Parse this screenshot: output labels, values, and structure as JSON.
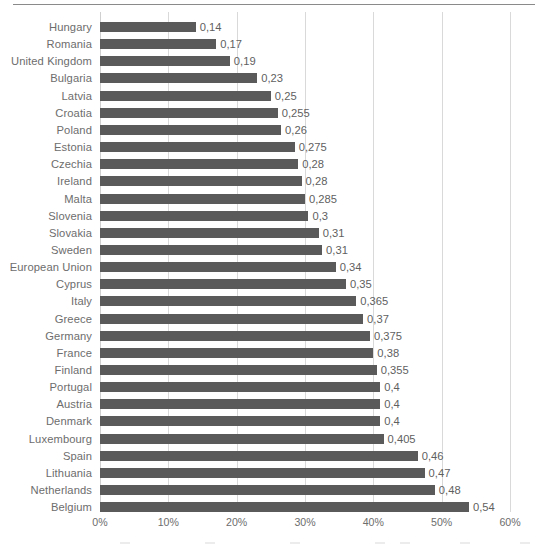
{
  "chart_data": {
    "type": "bar",
    "orientation": "horizontal",
    "title": "",
    "subtitle": "",
    "xlabel": "",
    "ylabel": "",
    "xlim": [
      0,
      0.6
    ],
    "xtick_labels": [
      "0%",
      "10%",
      "20%",
      "30%",
      "40%",
      "50%",
      "60%"
    ],
    "xtick_values": [
      0,
      0.1,
      0.2,
      0.3,
      0.4,
      0.5,
      0.6
    ],
    "grid": "vertical",
    "legend": "none",
    "bar_color": "#5a5a5a",
    "gridline_color": "#d9d9d9",
    "label_color": "#6d6d6d",
    "decimal_separator": ",",
    "categories": [
      "Hungary",
      "Romania",
      "United Kingdom",
      "Bulgaria",
      "Latvia",
      "Croatia",
      "Poland",
      "Estonia",
      "Czechia",
      "Ireland",
      "Malta",
      "Slovenia",
      "Slovakia",
      "Sweden",
      "European Union",
      "Cyprus",
      "Italy",
      "Greece",
      "Germany",
      "France",
      "Finland",
      "Portugal",
      "Austria",
      "Denmark",
      "Luxembourg",
      "Spain",
      "Lithuania",
      "Netherlands",
      "Belgium"
    ],
    "values": [
      0.14,
      0.17,
      0.19,
      0.23,
      0.25,
      0.255,
      0.26,
      0.275,
      0.28,
      0.28,
      0.285,
      0.3,
      0.31,
      0.31,
      0.34,
      0.35,
      0.365,
      0.37,
      0.375,
      0.38,
      0.355,
      0.4,
      0.4,
      0.4,
      0.405,
      0.46,
      0.47,
      0.48,
      0.54
    ],
    "value_labels": [
      "0,14",
      "0,17",
      "0,19",
      "0,23",
      "0,25",
      "0,255",
      "0,26",
      "0,275",
      "0,28",
      "0,28",
      "0,285",
      "0,3",
      "0,31",
      "0,31",
      "0,34",
      "0,35",
      "0,365",
      "0,37",
      "0,375",
      "0,38",
      "0,355",
      "0,4",
      "0,4",
      "0,4",
      "0,405",
      "0,46",
      "0,47",
      "0,48",
      "0,54"
    ],
    "bar_lengths": [
      0.14,
      0.17,
      0.19,
      0.23,
      0.25,
      0.26,
      0.265,
      0.285,
      0.29,
      0.295,
      0.3,
      0.305,
      0.32,
      0.325,
      0.345,
      0.36,
      0.375,
      0.385,
      0.395,
      0.4,
      0.405,
      0.41,
      0.41,
      0.41,
      0.415,
      0.465,
      0.475,
      0.49,
      0.54
    ]
  }
}
